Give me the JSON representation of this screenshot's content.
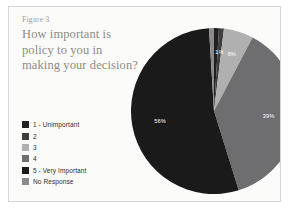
{
  "figure": {
    "label": "Figure 3",
    "question": "How important is policy to you in making your decision?"
  },
  "legend": {
    "items": [
      {
        "label": "1 - Unimportant",
        "color": "#231f20"
      },
      {
        "label": "2",
        "color": "#3f3f40"
      },
      {
        "label": "3",
        "color": "#b0b0b0"
      },
      {
        "label": "4",
        "color": "#6e6e70"
      },
      {
        "label": "5 - Very Important",
        "color": "#1a1a1a"
      },
      {
        "label": "No Response",
        "color": "#8a8a8c"
      }
    ]
  },
  "chart_data": {
    "type": "pie",
    "title": "How important is policy to you in making your decision?",
    "categories": [
      "1 - Unimportant",
      "2",
      "3",
      "4",
      "5 - Very Important",
      "No Response"
    ],
    "values": [
      1,
      1,
      6,
      39,
      56,
      1
    ],
    "value_unit": "%",
    "colors": [
      "#231f20",
      "#3f3f40",
      "#b0b0b0",
      "#6e6e70",
      "#1a1a1a",
      "#8a8a8c"
    ],
    "visible_labels": [
      {
        "category": "3",
        "text": "6%"
      },
      {
        "category": "4",
        "text": "39%"
      },
      {
        "category": "5 - Very Important",
        "text": "56%"
      },
      {
        "category": "2",
        "text": "1%"
      }
    ],
    "legend_position": "bottom-left",
    "grid": false,
    "xlabel": "",
    "ylabel": ""
  }
}
